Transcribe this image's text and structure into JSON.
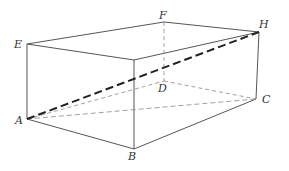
{
  "figure": {
    "type": "rectangular-prism",
    "line_color": "#555555",
    "diagonal_color": "#222222",
    "hidden_color": "#888888",
    "vertices": {
      "A": [
        27,
        119
      ],
      "B": [
        134,
        149
      ],
      "C": [
        256,
        99
      ],
      "D": [
        164,
        81
      ],
      "E": [
        27,
        44
      ],
      "G": [
        134,
        60
      ],
      "H": [
        259,
        32
      ],
      "F": [
        164,
        22
      ]
    },
    "labels": [
      {
        "id": "E",
        "text": "E",
        "x": 14,
        "y": 39
      },
      {
        "id": "F",
        "text": "F",
        "x": 159,
        "y": 10
      },
      {
        "id": "H",
        "text": "H",
        "x": 259,
        "y": 19
      },
      {
        "id": "D",
        "text": "D",
        "x": 158,
        "y": 83
      },
      {
        "id": "C",
        "text": "C",
        "x": 262,
        "y": 94
      },
      {
        "id": "A",
        "text": "A",
        "x": 15,
        "y": 115
      },
      {
        "id": "B",
        "text": "B",
        "x": 128,
        "y": 151
      }
    ],
    "visible_edges": [
      [
        "E",
        "F"
      ],
      [
        "F",
        "H"
      ],
      [
        "E",
        "G"
      ],
      [
        "G",
        "H"
      ],
      [
        "E",
        "A"
      ],
      [
        "G",
        "B"
      ],
      [
        "H",
        "C"
      ],
      [
        "A",
        "B"
      ],
      [
        "B",
        "C"
      ]
    ],
    "hidden_edges": [
      [
        "F",
        "D"
      ],
      [
        "A",
        "D"
      ],
      [
        "D",
        "C"
      ]
    ],
    "emphasized_dashed": [
      [
        "A",
        "H"
      ]
    ],
    "thin_lines": [
      [
        "A",
        "C"
      ]
    ]
  }
}
